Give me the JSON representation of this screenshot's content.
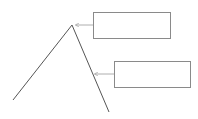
{
  "diagram": {
    "type": "labeled-apex-diagram",
    "colors": {
      "line": "#555555",
      "box_border": "#8a8a8a",
      "arrow": "#9a9a9a",
      "background": "#ffffff"
    },
    "callouts": [
      {
        "id": "apex-label",
        "text": "",
        "points_to": "apex"
      },
      {
        "id": "right-leg-label",
        "text": "",
        "points_to": "right-leg"
      }
    ]
  }
}
